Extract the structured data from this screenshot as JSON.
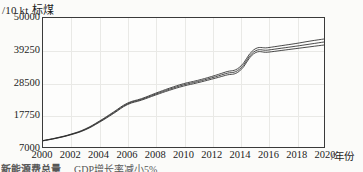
{
  "chart_data": {
    "type": "line",
    "title": "",
    "subtitle": "",
    "xlabel": "/年份",
    "ylabel": "/10 kt 标煤",
    "x": [
      2000,
      2001,
      2002,
      2003,
      2004,
      2005,
      2006,
      2007,
      2008,
      2009,
      2010,
      2011,
      2012,
      2013,
      2014,
      2015,
      2016,
      2017,
      2018,
      2019,
      2020
    ],
    "xlim": [
      2000,
      2020
    ],
    "ylim": [
      7000,
      50000
    ],
    "xticks": [
      "2000",
      "2002",
      "2004",
      "2006",
      "2008",
      "2010",
      "2012",
      "2014",
      "2016",
      "2018",
      "2020"
    ],
    "yticks": [
      "7000",
      "17750",
      "28500",
      "39250",
      "50000"
    ],
    "grid": true,
    "legend_position": "below-plot-cropped",
    "series": [
      {
        "name": "上界",
        "values": [
          9150,
          10100,
          11300,
          13000,
          15600,
          18600,
          21600,
          23100,
          24900,
          26600,
          28100,
          29200,
          30500,
          32000,
          33600,
          39400,
          40100,
          40800,
          41500,
          42300,
          43000
        ]
      },
      {
        "name": "中值",
        "values": [
          9100,
          10000,
          11200,
          12850,
          15400,
          18350,
          21350,
          22850,
          24600,
          26250,
          27700,
          28800,
          30050,
          31450,
          32950,
          38700,
          39300,
          39950,
          40600,
          41300,
          42000
        ]
      },
      {
        "name": "下界",
        "values": [
          9050,
          9950,
          11100,
          12700,
          15200,
          18100,
          21100,
          22600,
          24300,
          25900,
          27300,
          28400,
          29600,
          30900,
          32350,
          38100,
          38600,
          39200,
          39800,
          40400,
          41000
        ]
      }
    ],
    "annotations": {
      "legend_cropped_left": "新能源费总量",
      "legend_cropped_right": "GDP增长率减小5%"
    }
  }
}
